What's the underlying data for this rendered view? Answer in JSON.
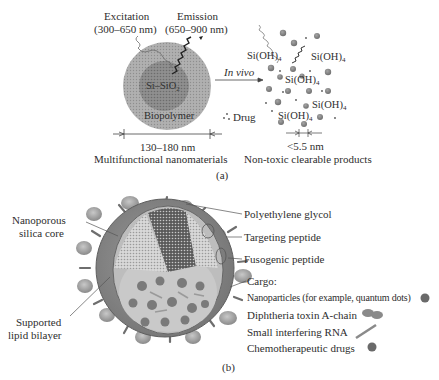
{
  "panel_a": {
    "caption": "(a)",
    "excitation": {
      "title": "Excitation",
      "range": "(300–650 nm)"
    },
    "emission": {
      "title": "Emission",
      "range": "(650–900 nm)"
    },
    "core_label": "Si–SiO",
    "core_sub": "2",
    "shell_label": "Biopolymer",
    "size_label": "130–180 nm",
    "left_caption": "Multifunctional nanomaterials",
    "arrow_label": "In vivo",
    "drug_label": "Drug",
    "products": [
      {
        "text": "Si(OH)",
        "sub": "4"
      },
      {
        "text": "Si(OH)",
        "sub": "4"
      },
      {
        "text": "Si(OH)",
        "sub": "4"
      },
      {
        "text": "Si(OH)",
        "sub": "4"
      },
      {
        "text": "Si(OH)",
        "sub": "4"
      }
    ],
    "product_size_label": "<5.5 nm",
    "right_caption": "Non-toxic clearable products"
  },
  "panel_b": {
    "caption": "(b)",
    "left_labels": {
      "core": [
        "Nanoporous",
        "silica core"
      ],
      "bilayer": [
        "Supported",
        "lipid bilayer"
      ]
    },
    "right_labels": {
      "peg": "Polyethylene glycol",
      "targeting": "Targeting peptide",
      "fusogenic": "Fusogenic peptide",
      "cargo_title": "Cargo:",
      "cargo_items": [
        "Nanoparticles (for example, quantum dots)",
        "Diphtheria toxin A-chain",
        "Small interfering RNA",
        "Chemotherapeutic drugs"
      ]
    }
  },
  "colors": {
    "shell": "#a8a8a8",
    "core": "#8c8c8c",
    "text": "#2e2e2e",
    "sphere": "#7d7d7d",
    "cargo_dot": "#6e6e6e"
  }
}
